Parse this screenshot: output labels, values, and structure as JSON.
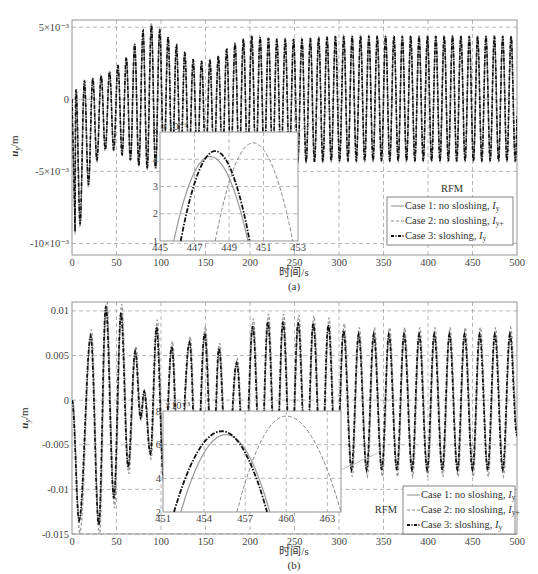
{
  "chart_data": [
    {
      "panel": "(a)",
      "type": "line",
      "title": "",
      "xlabel": "时间/s",
      "ylabel": "u_y/m",
      "caption": "(a)",
      "xlim": [
        0,
        500
      ],
      "ylim": [
        -0.0108,
        0.0055
      ],
      "xticks": [
        0,
        50,
        100,
        150,
        200,
        250,
        300,
        350,
        400,
        450,
        500
      ],
      "yticks": [
        -0.01,
        -0.005,
        0,
        0.005
      ],
      "ytick_labels": [
        "-10×10⁻³",
        "-5×10⁻³",
        "0",
        "5×10⁻³"
      ],
      "grid": true,
      "period_s": 9.4,
      "envelope_max": [
        [
          0,
          0.0
        ],
        [
          8,
          0.0012
        ],
        [
          20,
          0.0014
        ],
        [
          40,
          0.0018
        ],
        [
          60,
          0.0028
        ],
        [
          80,
          0.0048
        ],
        [
          90,
          0.0052
        ],
        [
          100,
          0.0048
        ],
        [
          120,
          0.0036
        ],
        [
          140,
          0.0026
        ],
        [
          160,
          0.0028
        ],
        [
          180,
          0.0038
        ],
        [
          200,
          0.0044
        ],
        [
          230,
          0.0042
        ],
        [
          260,
          0.0042
        ],
        [
          300,
          0.0044
        ],
        [
          500,
          0.0044
        ]
      ],
      "envelope_min": [
        [
          0,
          0.0
        ],
        [
          4,
          -0.0105
        ],
        [
          14,
          -0.007
        ],
        [
          25,
          -0.0045
        ],
        [
          40,
          -0.0033
        ],
        [
          60,
          -0.004
        ],
        [
          80,
          -0.0048
        ],
        [
          100,
          -0.0048
        ],
        [
          130,
          -0.0045
        ],
        [
          160,
          -0.0045
        ],
        [
          200,
          -0.0045
        ],
        [
          300,
          -0.0043
        ],
        [
          500,
          -0.0043
        ]
      ],
      "series": [
        {
          "name": "Case 1: no sloshing, I_y",
          "style": "solid",
          "color": "#8a8a8a"
        },
        {
          "name": "Case 2: no sloshing, I_y+",
          "style": "dashed",
          "color": "#9a9a9a"
        },
        {
          "name": "Case 3:  sloshing, I_y",
          "style": "dashdot",
          "color": "#111111"
        }
      ],
      "legend_title": "RFM",
      "legend_position": "lower right",
      "inset": {
        "xlim": [
          445,
          453
        ],
        "ylim": [
          1,
          5
        ],
        "xticks": [
          445,
          447,
          449,
          451,
          453
        ],
        "yticks": [
          1,
          2,
          3,
          4,
          5
        ],
        "y_multiplier": "×10⁻³",
        "curves": [
          {
            "series": "Case 1",
            "peak_x": 447.9,
            "peak_y": 4.1,
            "x_at_y1": [
              445.8,
              450.1
            ]
          },
          {
            "series": "Case 2",
            "peak_x": 450.4,
            "peak_y": 4.6,
            "x_at_y1": [
              448.2,
              452.7
            ]
          },
          {
            "series": "Case 3",
            "peak_x": 448.2,
            "peak_y": 4.3,
            "x_at_y1": [
              446.2,
              450.2
            ]
          }
        ]
      }
    },
    {
      "panel": "(b)",
      "type": "line",
      "title": "",
      "xlabel": "时间/s",
      "ylabel": "u_y/m",
      "caption": "(b)",
      "xlim": [
        0,
        500
      ],
      "ylim": [
        -0.015,
        0.011
      ],
      "xticks": [
        0,
        50,
        100,
        150,
        200,
        250,
        300,
        350,
        400,
        450,
        500
      ],
      "yticks": [
        -0.015,
        -0.01,
        -0.005,
        0,
        0.005,
        0.01
      ],
      "ytick_labels": [
        "-0.015",
        "-0.01",
        "-0.005",
        "0",
        "0.005",
        "0.01"
      ],
      "grid": true,
      "peaks": [
        [
          0,
          0
        ],
        [
          8,
          -0.0135
        ],
        [
          21,
          0.0072
        ],
        [
          30,
          -0.014
        ],
        [
          38,
          0.0105
        ],
        [
          47,
          -0.011
        ],
        [
          55,
          0.0098
        ],
        [
          63,
          -0.0075
        ],
        [
          71,
          0.0055
        ],
        [
          77,
          -0.002
        ],
        [
          81,
          0.001
        ],
        [
          88,
          -0.006
        ],
        [
          95,
          0.0082
        ],
        [
          103,
          -0.009
        ],
        [
          112,
          0.006
        ],
        [
          120,
          -0.009
        ],
        [
          132,
          0.0065
        ],
        [
          140,
          -0.009
        ],
        [
          149,
          0.0075
        ],
        [
          158,
          -0.009
        ],
        [
          165,
          0.0058
        ],
        [
          174,
          -0.009
        ],
        [
          185,
          0.0042
        ],
        [
          194,
          -0.009
        ],
        [
          203,
          0.0083
        ],
        [
          212,
          -0.009
        ],
        [
          220,
          0.0088
        ],
        [
          229,
          -0.009
        ],
        [
          237,
          0.0088
        ],
        [
          246,
          -0.009
        ],
        [
          254,
          0.0087
        ],
        [
          263,
          -0.009
        ],
        [
          271,
          0.0086
        ],
        [
          280,
          -0.009
        ],
        [
          288,
          0.0084
        ],
        [
          297,
          -0.009
        ],
        [
          305,
          0.0078
        ],
        [
          314,
          -0.0078
        ],
        [
          322,
          0.0074
        ],
        [
          331,
          -0.0078
        ],
        [
          339,
          0.0074
        ],
        [
          348,
          -0.0078
        ],
        [
          356,
          0.0074
        ],
        [
          365,
          -0.0078
        ],
        [
          373,
          0.0074
        ],
        [
          382,
          -0.0078
        ],
        [
          390,
          0.0074
        ],
        [
          399,
          -0.0078
        ],
        [
          407,
          0.0074
        ],
        [
          416,
          -0.0078
        ],
        [
          424,
          0.0074
        ],
        [
          433,
          -0.0078
        ],
        [
          441,
          0.0074
        ],
        [
          450,
          -0.0078
        ],
        [
          458,
          0.0074
        ],
        [
          467,
          -0.0078
        ],
        [
          475,
          0.0074
        ],
        [
          484,
          -0.0078
        ],
        [
          492,
          0.0074
        ],
        [
          500,
          -0.004
        ]
      ],
      "case2_scale": 1.1,
      "series": [
        {
          "name": "Case 1: no sloshing, I_y",
          "style": "solid",
          "color": "#8a8a8a"
        },
        {
          "name": "Case 2: no sloshing, I_y+",
          "style": "dashed",
          "color": "#9a9a9a"
        },
        {
          "name": "Case 3:  sloshing, I_y",
          "style": "dashdot",
          "color": "#111111"
        }
      ],
      "legend_title": "RFM",
      "legend_position": "lower right",
      "inset": {
        "xlim": [
          451,
          464
        ],
        "ylim": [
          2,
          8
        ],
        "xticks": [
          451,
          454,
          457,
          460,
          463
        ],
        "yticks": [
          2,
          4,
          6,
          8
        ],
        "y_multiplier": "×10⁻³",
        "curves": [
          {
            "series": "Case 1",
            "peak_x": 455.6,
            "peak_y": 6.6,
            "x_at_y1": [
              452.3,
              458.8
            ]
          },
          {
            "series": "Case 2",
            "peak_x": 460.0,
            "peak_y": 7.7,
            "x_at_y1": [
              456.4,
              464.0
            ]
          },
          {
            "series": "Case 3",
            "peak_x": 455.3,
            "peak_y": 6.8,
            "x_at_y1": [
              451.8,
              458.6
            ]
          }
        ]
      }
    }
  ],
  "legend": {
    "title": "RFM",
    "items": [
      {
        "case": "Case 1:",
        "desc": "no sloshing,",
        "sym": "I",
        "sub": "y"
      },
      {
        "case": "Case 2:",
        "desc": "no sloshing,",
        "sym": "I",
        "sub": "y+"
      },
      {
        "case": "Case 3:",
        "desc": " sloshing,",
        "sym": "I",
        "sub": "y"
      }
    ]
  },
  "labels": {
    "xlabel": "时间/s",
    "ylabel_main": "u",
    "ylabel_sub": "y",
    "ylabel_unit": "/m",
    "caption_a": "(a)",
    "caption_b": "(b)",
    "inset_mult_a": "×10⁻³",
    "inset_mult_b": "×10⁻³"
  }
}
